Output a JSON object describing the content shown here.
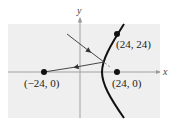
{
  "diagram": {
    "type": "hyperbola-reflection",
    "axes": {
      "x_label": "x",
      "y_label": "y"
    },
    "points": [
      {
        "id": "left-focus",
        "label": "(−24, 0)",
        "x": -24,
        "y": 0
      },
      {
        "id": "right-focus",
        "label": "(24, 0)",
        "x": 24,
        "y": 0
      },
      {
        "id": "curve-point",
        "label": "(24, 24)",
        "x": 24,
        "y": 24
      }
    ],
    "colors": {
      "grid_background": "#eeeeee",
      "axis": "#999999",
      "curve": "#111111",
      "ray": "#333333"
    }
  }
}
